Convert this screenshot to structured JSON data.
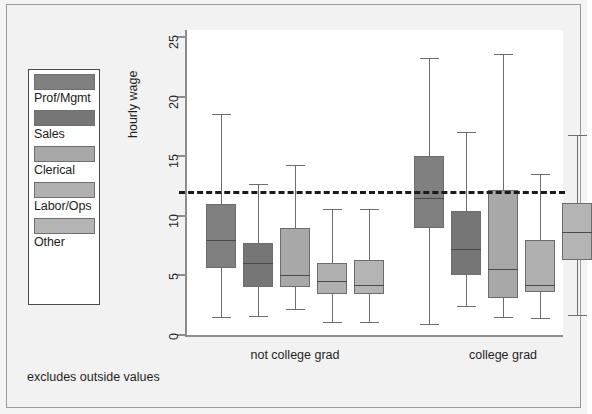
{
  "chart_data": {
    "type": "boxplot",
    "title": "",
    "xlabel": "",
    "ylabel": "hourly wage",
    "ylim": [
      0,
      25
    ],
    "yticks": [
      0,
      5,
      10,
      15,
      20,
      25
    ],
    "ytick_labels": [
      "0",
      "5",
      "10",
      "15",
      "20",
      "25"
    ],
    "grid": false,
    "legend_position": "left-outside",
    "footnote": "excludes outside values",
    "reference_line": {
      "value": 12,
      "style": "dashed",
      "color": "#1a1a1a"
    },
    "categories": [
      "not college grad",
      "college grad"
    ],
    "groups": [
      "Prof/Mgmt",
      "Sales",
      "Clerical",
      "Labor/Ops",
      "Other"
    ],
    "group_colors": [
      "#808080",
      "#767676",
      "#a8a8a8",
      "#b0b0b0",
      "#b4b4b4"
    ],
    "series": [
      {
        "name": "not college grad",
        "boxes": [
          {
            "group": "Prof/Mgmt",
            "whisker_low": 1.5,
            "q1": 5.6,
            "median": 8.0,
            "q3": 11.0,
            "whisker_high": 18.5
          },
          {
            "group": "Sales",
            "whisker_low": 1.6,
            "q1": 4.0,
            "median": 6.0,
            "q3": 7.7,
            "whisker_high": 12.7
          },
          {
            "group": "Clerical",
            "whisker_low": 2.2,
            "q1": 4.0,
            "median": 5.0,
            "q3": 9.0,
            "whisker_high": 14.3
          },
          {
            "group": "Labor/Ops",
            "whisker_low": 1.1,
            "q1": 3.4,
            "median": 4.5,
            "q3": 6.0,
            "whisker_high": 10.6
          },
          {
            "group": "Other",
            "whisker_low": 1.1,
            "q1": 3.4,
            "median": 4.2,
            "q3": 6.3,
            "whisker_high": 10.6
          }
        ]
      },
      {
        "name": "college grad",
        "boxes": [
          {
            "group": "Prof/Mgmt",
            "whisker_low": 0.9,
            "q1": 9.0,
            "median": 11.5,
            "q3": 15.0,
            "whisker_high": 23.2
          },
          {
            "group": "Sales",
            "whisker_low": 2.4,
            "q1": 5.0,
            "median": 7.2,
            "q3": 10.4,
            "whisker_high": 17.0
          },
          {
            "group": "Clerical",
            "whisker_low": 1.5,
            "q1": 3.1,
            "median": 5.5,
            "q3": 12.2,
            "whisker_high": 23.6
          },
          {
            "group": "Labor/Ops",
            "whisker_low": 1.4,
            "q1": 3.6,
            "median": 4.2,
            "q3": 8.0,
            "whisker_high": 13.5
          },
          {
            "group": "Other",
            "whisker_low": 1.7,
            "q1": 6.3,
            "median": 8.6,
            "q3": 11.1,
            "whisker_high": 16.8
          }
        ]
      }
    ]
  },
  "legend": {
    "items": [
      {
        "label": "Prof/Mgmt",
        "color": "#808080"
      },
      {
        "label": "Sales",
        "color": "#767676"
      },
      {
        "label": "Clerical",
        "color": "#a8a8a8"
      },
      {
        "label": "Labor/Ops",
        "color": "#b0b0b0"
      },
      {
        "label": "Other",
        "color": "#b4b4b4"
      }
    ]
  },
  "axes": {
    "y_title": "hourly wage",
    "y_ticks": [
      "0",
      "5",
      "10",
      "15",
      "20",
      "25"
    ],
    "x_labels": [
      "not college grad",
      "college grad"
    ]
  },
  "footnote": "excludes outside values"
}
